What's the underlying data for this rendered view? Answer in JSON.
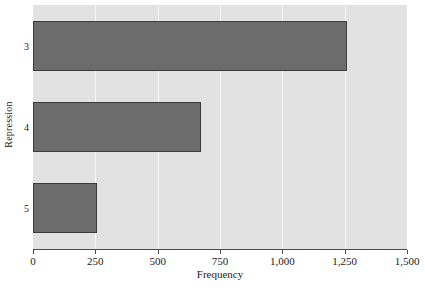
{
  "chart_data": {
    "type": "bar",
    "orientation": "horizontal",
    "title": "",
    "xlabel": "Frequency",
    "ylabel": "Repression",
    "categories": [
      "3",
      "4",
      "5"
    ],
    "values": [
      1261,
      673,
      255
    ],
    "xlim": [
      0,
      1500
    ],
    "xticks": [
      0,
      250,
      500,
      750,
      1000,
      1250,
      1500
    ],
    "xticklabels": [
      "0",
      "250",
      "500",
      "750",
      "1,000",
      "1,250",
      "1,500"
    ],
    "grid": true,
    "grid_axis": "x",
    "legend": false,
    "colors": {
      "bar_fill": "#6c6c6c",
      "bar_edge": "#3c3c3c",
      "plot_background": "#e2e2e2",
      "gridline": "#f7f7f7",
      "figure_background": "#ffffff",
      "text": "#1a1a1a",
      "axis_line": "#4a4a4a"
    }
  }
}
